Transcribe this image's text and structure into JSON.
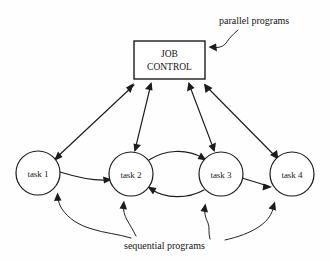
{
  "diagram": {
    "title_box": {
      "line1": "JOB",
      "line2": "CONTROL"
    },
    "annotations": [
      {
        "name": "parallel-programs",
        "text": "parallel programs"
      },
      {
        "name": "sequential-programs",
        "text": "sequential programs"
      }
    ],
    "nodes": [
      {
        "id": "task1",
        "label": "task 1",
        "cx": 38,
        "cy": 173,
        "r": 22
      },
      {
        "id": "task2",
        "label": "task 2",
        "cx": 131,
        "cy": 174,
        "r": 22
      },
      {
        "id": "task3",
        "label": "task 3",
        "cx": 221,
        "cy": 174,
        "r": 22
      },
      {
        "id": "task4",
        "label": "task 4",
        "cx": 292,
        "cy": 174,
        "r": 22
      }
    ],
    "edges": [
      {
        "from": "task1",
        "to": "job-control",
        "style": "double-arrow"
      },
      {
        "from": "task2",
        "to": "job-control",
        "style": "double-arrow"
      },
      {
        "from": "task3",
        "to": "job-control",
        "style": "double-arrow"
      },
      {
        "from": "task4",
        "to": "job-control",
        "style": "double-arrow"
      },
      {
        "from": "task1",
        "to": "task2",
        "style": "arrow"
      },
      {
        "from": "task2",
        "to": "task3",
        "style": "curved-arrow-upper"
      },
      {
        "from": "task3",
        "to": "task2",
        "style": "curved-arrow-lower"
      },
      {
        "from": "task3",
        "to": "task4",
        "style": "arrow"
      }
    ],
    "leaders": [
      {
        "to": "task1",
        "from": "sequential-programs"
      },
      {
        "to": "task2",
        "from": "sequential-programs"
      },
      {
        "to": "task3",
        "from": "sequential-programs"
      },
      {
        "to": "task4",
        "from": "sequential-programs"
      },
      {
        "to": "job-control",
        "from": "parallel-programs"
      }
    ],
    "colors": {
      "ink": "#1c1c1c",
      "background": "#fefefe"
    }
  }
}
